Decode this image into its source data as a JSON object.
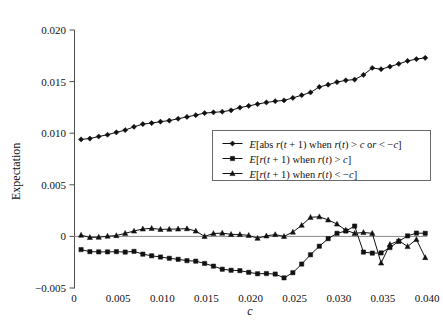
{
  "chart_data": {
    "type": "line",
    "title": "",
    "xlabel": "c",
    "ylabel": "Expectation",
    "xlim": [
      0,
      0.04
    ],
    "ylim": [
      -0.005,
      0.02
    ],
    "grid": false,
    "legend_position": "center-right",
    "x_ticks": [
      "0",
      "0.005",
      "0.010",
      "0.015",
      "0.020",
      "0.025",
      "0.030",
      "0.035",
      "0.040"
    ],
    "x_tick_values": [
      0,
      0.005,
      0.01,
      0.015,
      0.02,
      0.025,
      0.03,
      0.035,
      0.04
    ],
    "y_ticks": [
      "0.020",
      "0.015",
      "0.010",
      "0.005",
      "0",
      "−0.005"
    ],
    "y_tick_values": [
      0.02,
      0.015,
      0.01,
      0.005,
      0,
      -0.005
    ],
    "x": [
      0.0008,
      0.0018,
      0.0028,
      0.0038,
      0.0048,
      0.0058,
      0.0068,
      0.0078,
      0.0088,
      0.0098,
      0.0108,
      0.0118,
      0.0128,
      0.0138,
      0.0148,
      0.0158,
      0.0168,
      0.0178,
      0.0188,
      0.0198,
      0.0208,
      0.0218,
      0.0228,
      0.0238,
      0.0248,
      0.0258,
      0.0268,
      0.0278,
      0.0288,
      0.0298,
      0.0308,
      0.0318,
      0.0328,
      0.0338,
      0.0348,
      0.0358,
      0.0368,
      0.0378,
      0.0388,
      0.0398
    ],
    "series": [
      {
        "name": "E[abs r(t + 1) when r(t) > c or < −c]",
        "marker": "diamond",
        "values": [
          0.0094,
          0.00948,
          0.00968,
          0.00985,
          0.01008,
          0.0103,
          0.01062,
          0.01088,
          0.01098,
          0.01112,
          0.01122,
          0.0114,
          0.01158,
          0.01175,
          0.01195,
          0.01202,
          0.01208,
          0.01222,
          0.01248,
          0.01265,
          0.01282,
          0.01298,
          0.0131,
          0.01318,
          0.01342,
          0.01368,
          0.01395,
          0.01448,
          0.0147,
          0.01495,
          0.01512,
          0.0152,
          0.01565,
          0.01632,
          0.0162,
          0.01645,
          0.01672,
          0.017,
          0.01718,
          0.0173
        ]
      },
      {
        "name": "E[r(t + 1) when r(t) > c]",
        "marker": "square",
        "values": [
          -0.00128,
          -0.00148,
          -0.0015,
          -0.0015,
          -0.00148,
          -0.00152,
          -0.00145,
          -0.00172,
          -0.00188,
          -0.002,
          -0.00212,
          -0.00222,
          -0.00235,
          -0.0024,
          -0.00262,
          -0.00288,
          -0.00318,
          -0.00328,
          -0.00332,
          -0.00348,
          -0.00362,
          -0.0036,
          -0.00365,
          -0.00402,
          -0.00352,
          -0.00268,
          -0.00178,
          -0.00095,
          -0.00022,
          0.0003,
          0.00052,
          0.001,
          -0.00152,
          -0.00162,
          -0.0016,
          -0.00108,
          -0.00048,
          5e-05,
          0.00032,
          0.0003
        ]
      },
      {
        "name": "E[r(t + 1) when r(t) < −c]",
        "marker": "triangle",
        "values": [
          0.00012,
          -0.0001,
          -8e-05,
          2e-05,
          8e-05,
          0.0003,
          0.00052,
          0.00072,
          0.00078,
          0.00068,
          0.0007,
          0.00072,
          0.00075,
          0.00052,
          0.0,
          0.00028,
          0.00032,
          0.0002,
          0.00018,
          0.0001,
          -0.00018,
          5e-05,
          0.00018,
          0.0,
          0.00042,
          0.00108,
          0.00185,
          0.0019,
          0.0016,
          0.0012,
          0.0006,
          0.0003,
          0.00038,
          0.0003,
          -0.00258,
          -0.00078,
          -0.00042,
          -0.00098,
          -0.0003,
          -0.00205
        ]
      }
    ]
  },
  "legend": {
    "entries": [
      {
        "label": "E[abs r(t + 1) when r(t) > c or < −c]",
        "marker": "diamond"
      },
      {
        "label": "E[r(t + 1) when r(t) > c]",
        "marker": "square"
      },
      {
        "label": "E[r(t + 1) when r(t) < −c]",
        "marker": "triangle"
      }
    ]
  }
}
